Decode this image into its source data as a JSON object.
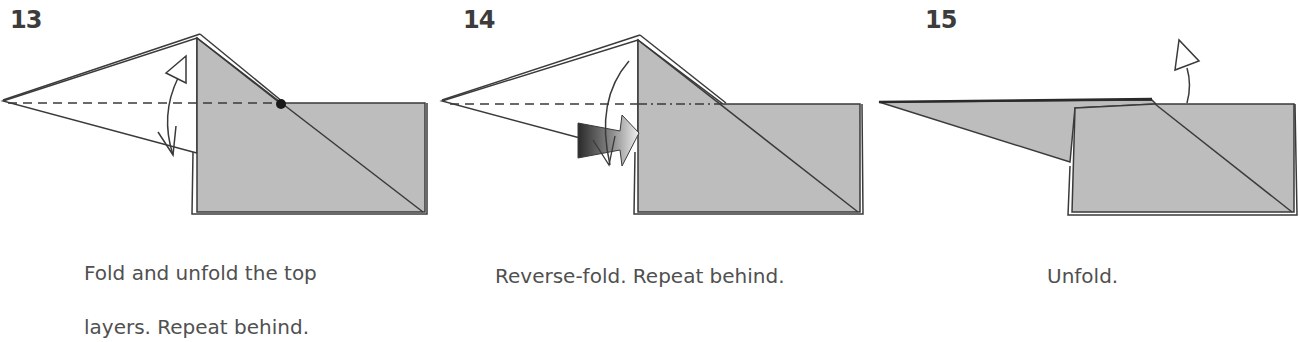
{
  "colors": {
    "paper_fill": "#bdbdbd",
    "line": "#3a3a3a",
    "text": "#505050",
    "step_number": "#3c3c3c"
  },
  "steps": [
    {
      "number": "13",
      "caption_line1": "Fold and unfold the top",
      "caption_line2": "layers. Repeat behind.",
      "symbols": [
        "valley-fold-dashed-line",
        "fold-unfold-arrow",
        "reference-dot"
      ]
    },
    {
      "number": "14",
      "caption_line1": "Reverse-fold. Repeat behind.",
      "symbols": [
        "dash-dot-mountain-line",
        "valley-fold-dashed-line",
        "reverse-fold-arrow",
        "curved-arrow"
      ]
    },
    {
      "number": "15",
      "caption_line1": "Unfold.",
      "symbols": [
        "unfold-arrow"
      ]
    }
  ]
}
